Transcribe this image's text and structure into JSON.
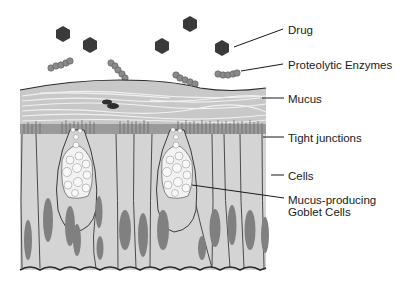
{
  "diagram": {
    "labels": {
      "drug": "Drug",
      "enzymes": "Proteolytic Enzymes",
      "mucus": "Mucus",
      "tight_junctions": "Tight junctions",
      "cells": "Cells",
      "goblet_line1": "Mucus-producing",
      "goblet_line2": "Goblet Cells"
    },
    "colors": {
      "drug": "#3a3a3a",
      "enzyme": "#8a8a8a",
      "mucus_layer": "#c8c8c8",
      "mucus_strands": "#f4f4f4",
      "cell_fill": "#d4d4d4",
      "nucleus": "#808080",
      "goblet_granule": "#f2f2f2",
      "outline": "#2a2a2a"
    }
  }
}
